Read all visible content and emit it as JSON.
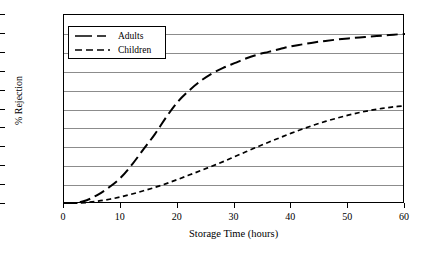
{
  "chart_data": {
    "type": "line",
    "title": "",
    "xlabel": "Storage Time (hours)",
    "ylabel": "% Rejection",
    "xlim": [
      0,
      60
    ],
    "ylim": [
      0,
      100
    ],
    "xticks": [
      0,
      10,
      20,
      30,
      40,
      50,
      60
    ],
    "yticks": [
      0,
      10,
      20,
      30,
      40,
      50,
      60,
      70,
      80,
      90,
      100
    ],
    "grid": "horizontal",
    "legend_position": "top-left",
    "series": [
      {
        "name": "Adults",
        "linestyle": "long-dash",
        "color": "#000000",
        "x": [
          0,
          2,
          4,
          6,
          8,
          10,
          12,
          14,
          16,
          18,
          20,
          22,
          24,
          26,
          28,
          30,
          32,
          34,
          36,
          38,
          40,
          42,
          44,
          46,
          48,
          50,
          52,
          54,
          56,
          58,
          60
        ],
        "y": [
          0,
          0.5,
          2,
          5,
          9,
          14,
          21,
          29,
          37,
          46,
          54,
          60,
          65,
          69,
          72,
          74.5,
          77,
          79,
          80.5,
          82,
          83.5,
          84.5,
          85.5,
          86.3,
          87,
          87.6,
          88.1,
          88.6,
          89.1,
          89.6,
          90
        ]
      },
      {
        "name": "Children",
        "linestyle": "short-dash",
        "color": "#000000",
        "x": [
          0,
          2,
          4,
          6,
          8,
          10,
          12,
          14,
          16,
          18,
          20,
          22,
          24,
          26,
          28,
          30,
          32,
          34,
          36,
          38,
          40,
          42,
          44,
          46,
          48,
          50,
          52,
          54,
          56,
          58,
          60
        ],
        "y": [
          0,
          0.3,
          0.8,
          1.5,
          2.5,
          3.8,
          5.3,
          7.0,
          8.8,
          10.8,
          13.0,
          15.3,
          17.6,
          20.0,
          22.4,
          25.0,
          27.6,
          30.2,
          32.7,
          35.1,
          37.5,
          39.7,
          41.8,
          43.7,
          45.4,
          47.0,
          48.4,
          49.6,
          50.6,
          51.4,
          52.0
        ]
      }
    ]
  },
  "legend": {
    "items": [
      {
        "label": "Adults"
      },
      {
        "label": "Children"
      }
    ]
  }
}
